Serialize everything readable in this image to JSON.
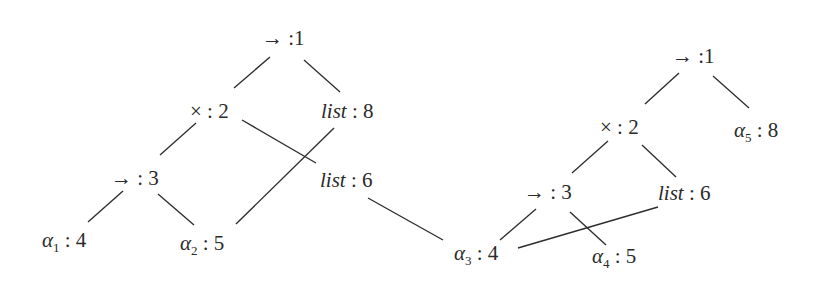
{
  "diagram": {
    "type": "type-term trees with node numbering",
    "colors": {
      "ink": "#2a2a2a",
      "background": "#ffffff"
    },
    "trees": [
      {
        "id": "left",
        "nodes": [
          {
            "id": "L1",
            "symbol": "→",
            "number": "1",
            "x": 262,
            "y": 45
          },
          {
            "id": "L2",
            "symbol": "×",
            "number": "2",
            "x": 190,
            "y": 118
          },
          {
            "id": "L8",
            "symbol": "list",
            "italic": true,
            "number": "8",
            "x": 321,
            "y": 118
          },
          {
            "id": "L3",
            "symbol": "→",
            "number": "3",
            "x": 111,
            "y": 185
          },
          {
            "id": "L6",
            "symbol": "list",
            "italic": true,
            "number": "6",
            "x": 320,
            "y": 187
          },
          {
            "id": "L4",
            "symbol": "α",
            "subscript": "1",
            "number": "4",
            "x": 42,
            "y": 247
          },
          {
            "id": "L5",
            "symbol": "α",
            "subscript": "2",
            "number": "5",
            "x": 180,
            "y": 250
          }
        ],
        "edges": [
          {
            "from": "L1",
            "to": "L2",
            "x1": 270,
            "y1": 57,
            "x2": 234,
            "y2": 88
          },
          {
            "from": "L1",
            "to": "L8",
            "x1": 304,
            "y1": 60,
            "x2": 340,
            "y2": 92
          },
          {
            "from": "L2",
            "to": "L3",
            "x1": 196,
            "y1": 123,
            "x2": 160,
            "y2": 155
          },
          {
            "from": "L2",
            "to": "L6",
            "x1": 242,
            "y1": 120,
            "x2": 316,
            "y2": 163
          },
          {
            "from": "L8",
            "to": "L5",
            "x1": 334,
            "y1": 128,
            "x2": 236,
            "y2": 224
          },
          {
            "from": "L3",
            "to": "L4",
            "x1": 123,
            "y1": 191,
            "x2": 88,
            "y2": 222
          },
          {
            "from": "L3",
            "to": "L5",
            "x1": 158,
            "y1": 194,
            "x2": 194,
            "y2": 225
          },
          {
            "from": "L6",
            "to": "R4",
            "x1": 368,
            "y1": 198,
            "x2": 443,
            "y2": 240
          }
        ]
      },
      {
        "id": "right",
        "nodes": [
          {
            "id": "R1",
            "symbol": "→",
            "number": "1",
            "x": 672,
            "y": 63
          },
          {
            "id": "R2",
            "symbol": "×",
            "number": "2",
            "x": 600,
            "y": 134
          },
          {
            "id": "R8",
            "symbol": "α",
            "subscript": "5",
            "number": "8",
            "x": 734,
            "y": 137
          },
          {
            "id": "R3",
            "symbol": "→",
            "number": "3",
            "x": 524,
            "y": 199
          },
          {
            "id": "R6",
            "symbol": "list",
            "italic": true,
            "number": "6",
            "x": 658,
            "y": 200
          },
          {
            "id": "R4",
            "symbol": "α",
            "subscript": "3",
            "number": "4",
            "x": 454,
            "y": 260
          },
          {
            "id": "R5",
            "symbol": "α",
            "subscript": "4",
            "number": "5",
            "x": 592,
            "y": 263
          }
        ],
        "edges": [
          {
            "from": "R1",
            "to": "R2",
            "x1": 679,
            "y1": 73,
            "x2": 645,
            "y2": 104
          },
          {
            "from": "R1",
            "to": "R8",
            "x1": 713,
            "y1": 76,
            "x2": 749,
            "y2": 108
          },
          {
            "from": "R2",
            "to": "R3",
            "x1": 608,
            "y1": 141,
            "x2": 572,
            "y2": 173
          },
          {
            "from": "R2",
            "to": "R6",
            "x1": 642,
            "y1": 145,
            "x2": 676,
            "y2": 177
          },
          {
            "from": "R3",
            "to": "R4",
            "x1": 536,
            "y1": 209,
            "x2": 500,
            "y2": 240
          },
          {
            "from": "R3",
            "to": "R5",
            "x1": 570,
            "y1": 212,
            "x2": 606,
            "y2": 245
          },
          {
            "from": "R6",
            "to": "R4",
            "x1": 658,
            "y1": 207,
            "x2": 518,
            "y2": 248
          }
        ]
      }
    ]
  }
}
